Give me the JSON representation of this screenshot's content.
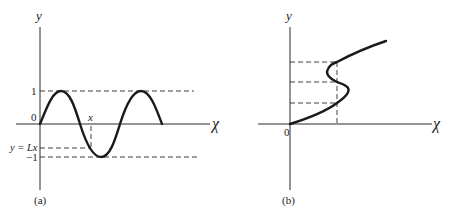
{
  "panel_a": {
    "caption": "(a)",
    "y_axis_label": "y",
    "x_axis_label": "χ",
    "origin_label": "0",
    "tick_one": "1",
    "tick_minus_one": "−1",
    "line_label": "y = Lx",
    "x_marker_label": "x",
    "curve_description": "sine wave y = sin(χ) over two periods starting at origin",
    "dashed_lines": [
      "y = 1",
      "y = -1",
      "y = Lx",
      "vertical at x"
    ]
  },
  "panel_b": {
    "caption": "(b)",
    "y_axis_label": "y",
    "x_axis_label": "χ",
    "origin_label": "0",
    "curve_description": "S-shaped multivalued curve with three y-values for one x",
    "dashed_horizontal_count": 3,
    "dashed_vertical_count": 1
  },
  "colors": {
    "ink": "#1a1a1a",
    "background": "#ffffff"
  }
}
